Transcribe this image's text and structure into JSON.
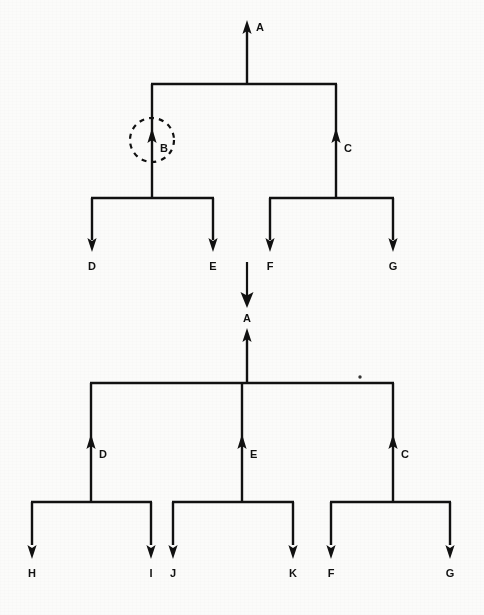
{
  "figure": {
    "background_color": "#fbfbfa",
    "ink_color": "#111111",
    "stroke_width": 2.4,
    "width": 484,
    "height": 615
  },
  "transition_arrow": {
    "name": "downward-transition-arrow",
    "direction": "down",
    "x": 247,
    "y_start": 262,
    "y_end": 307
  },
  "trees": [
    {
      "id": "tree-before",
      "caption": "",
      "root": {
        "label": "A",
        "x": 247,
        "arrow_tip_y": 22,
        "stem_bottom_y": 84,
        "direction": "up"
      },
      "bars": [
        {
          "name": "root-bar",
          "y": 84,
          "x1": 152,
          "x2": 336
        },
        {
          "name": "b-children-bar",
          "y": 198,
          "x1": 92,
          "x2": 213
        },
        {
          "name": "c-children-bar",
          "y": 198,
          "x1": 270,
          "x2": 393
        }
      ],
      "nodes": [
        {
          "label": "A",
          "x": 247,
          "y": 22,
          "direction": "up",
          "label_side": "right",
          "highlighted": false
        },
        {
          "label": "B",
          "x": 152,
          "y": 131,
          "direction": "up",
          "label_side": "right",
          "highlighted": true
        },
        {
          "label": "C",
          "x": 336,
          "y": 131,
          "direction": "up",
          "label_side": "right",
          "highlighted": false
        },
        {
          "label": "D",
          "x": 92,
          "y": 250,
          "direction": "down",
          "label_side": "below",
          "highlighted": false
        },
        {
          "label": "E",
          "x": 213,
          "y": 250,
          "direction": "down",
          "label_side": "below",
          "highlighted": false
        },
        {
          "label": "F",
          "x": 270,
          "y": 250,
          "direction": "down",
          "label_side": "below",
          "highlighted": false
        },
        {
          "label": "G",
          "x": 393,
          "y": 250,
          "direction": "down",
          "label_side": "below",
          "highlighted": false
        }
      ],
      "highlight": {
        "name": "dashed-circle-highlight",
        "target_label": "B",
        "cx": 152,
        "cy": 140,
        "r": 22,
        "dash": "5 5"
      }
    },
    {
      "id": "tree-after",
      "caption": "",
      "root": {
        "label": "A",
        "x": 247,
        "arrow_tip_y": 330,
        "stem_bottom_y": 383,
        "direction": "up"
      },
      "bars": [
        {
          "name": "root-bar",
          "y": 383,
          "x1": 91,
          "x2": 393
        },
        {
          "name": "d-children-bar",
          "y": 502,
          "x1": 32,
          "x2": 151
        },
        {
          "name": "e-children-bar",
          "y": 502,
          "x1": 173,
          "x2": 293
        },
        {
          "name": "c-children-bar",
          "y": 502,
          "x1": 331,
          "x2": 450
        }
      ],
      "nodes": [
        {
          "label": "A",
          "x": 247,
          "y": 330,
          "direction": "up",
          "label_side": "right",
          "highlighted": false
        },
        {
          "label": "D",
          "x": 91,
          "y": 437,
          "direction": "up",
          "label_side": "right",
          "highlighted": false
        },
        {
          "label": "E",
          "x": 242,
          "y": 437,
          "direction": "up",
          "label_side": "right",
          "highlighted": false
        },
        {
          "label": "C",
          "x": 393,
          "y": 437,
          "direction": "up",
          "label_side": "right",
          "highlighted": false
        },
        {
          "label": "H",
          "x": 32,
          "y": 557,
          "direction": "down",
          "label_side": "below",
          "highlighted": false
        },
        {
          "label": "I",
          "x": 151,
          "y": 557,
          "direction": "down",
          "label_side": "below",
          "highlighted": false
        },
        {
          "label": "J",
          "x": 173,
          "y": 557,
          "direction": "down",
          "label_side": "below",
          "highlighted": false
        },
        {
          "label": "K",
          "x": 293,
          "y": 557,
          "direction": "down",
          "label_side": "below",
          "highlighted": false
        },
        {
          "label": "F",
          "x": 331,
          "y": 557,
          "direction": "down",
          "label_side": "below",
          "highlighted": false
        },
        {
          "label": "G",
          "x": 450,
          "y": 557,
          "direction": "down",
          "label_side": "below",
          "highlighted": false
        }
      ]
    }
  ],
  "speck": {
    "name": "scan-speck",
    "x": 360,
    "y": 377,
    "r": 1.6
  },
  "labels": {
    "A_top": "A",
    "B_top": "B",
    "C_top": "C",
    "D_top": "D",
    "E_top": "E",
    "F_top": "F",
    "G_top": "G",
    "A_mid": "A",
    "A_bottom": "A",
    "D_bottom": "D",
    "E_bottom": "E",
    "C_bottom": "C",
    "H_bottom": "H",
    "I_bottom": "I",
    "J_bottom": "J",
    "K_bottom": "K",
    "F_bottom": "F",
    "G_bottom": "G"
  }
}
